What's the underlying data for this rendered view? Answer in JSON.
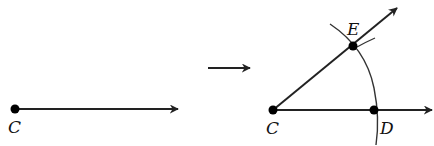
{
  "figure": {
    "before": {
      "point": {
        "label": "C",
        "x": 15,
        "y": 109
      },
      "ray_end": {
        "x": 178,
        "y": 109
      }
    },
    "transition_arrow": {
      "from": {
        "x": 208,
        "y": 68
      },
      "to": {
        "x": 250,
        "y": 68
      }
    },
    "after": {
      "points": [
        {
          "label": "C",
          "x": 273,
          "y": 110
        },
        {
          "label": "D",
          "x": 374,
          "y": 110
        },
        {
          "label": "E",
          "x": 353,
          "y": 46
        }
      ],
      "ray_CD_end": {
        "x": 432,
        "y": 110
      },
      "ray_CE_end": {
        "x": 397,
        "y": 8
      }
    },
    "labels": {
      "c_left": "C",
      "c_right": "C",
      "d": "D",
      "e": "E"
    },
    "colors": {
      "stroke": "#222222",
      "point": "#000000"
    }
  }
}
